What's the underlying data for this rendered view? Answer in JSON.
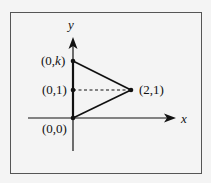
{
  "axes": {
    "x_label": "x",
    "y_label": "y"
  },
  "points": {
    "origin": {
      "label": "(0,0)",
      "x": 0,
      "y": 0
    },
    "unit_y": {
      "label": "(0,1)",
      "x": 0,
      "y": 1
    },
    "top": {
      "label_prefix": "(0,",
      "label_var": "k",
      "label_suffix": ")",
      "x": 0,
      "y": "k"
    },
    "right": {
      "label": "(2,1)",
      "x": 2,
      "y": 1
    }
  },
  "colors": {
    "line": "#111111",
    "frame": "#555555",
    "background": "#f4f4f4"
  }
}
